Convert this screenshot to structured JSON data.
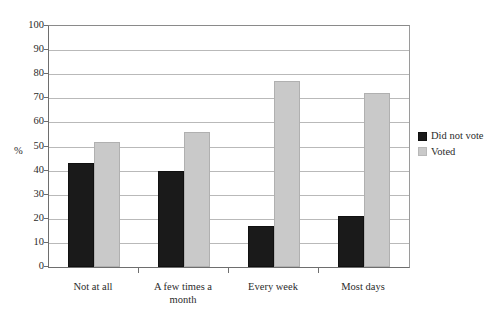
{
  "chart_data": {
    "type": "bar",
    "title": "",
    "subtitle": "",
    "xlabel": "",
    "ylabel": "%",
    "ylim": [
      0,
      100
    ],
    "ytick_step": 10,
    "yticks": [
      0,
      10,
      20,
      30,
      40,
      50,
      60,
      70,
      80,
      90,
      100
    ],
    "ytick_labels": [
      "0",
      "10",
      "20",
      "30",
      "40",
      "50",
      "60",
      "70",
      "80",
      "90",
      "100"
    ],
    "grid": true,
    "grid_axis": "y",
    "legend_position": "right",
    "categories": [
      "Not at all",
      "A few times a\nmonth",
      "Every week",
      "Most days"
    ],
    "series": [
      {
        "name": "Did not vote",
        "color": "#1a1a1a",
        "values": [
          43,
          40,
          17,
          21
        ]
      },
      {
        "name": "Voted",
        "color": "#c9c9c9",
        "values": [
          52,
          56,
          77,
          72
        ]
      }
    ]
  }
}
